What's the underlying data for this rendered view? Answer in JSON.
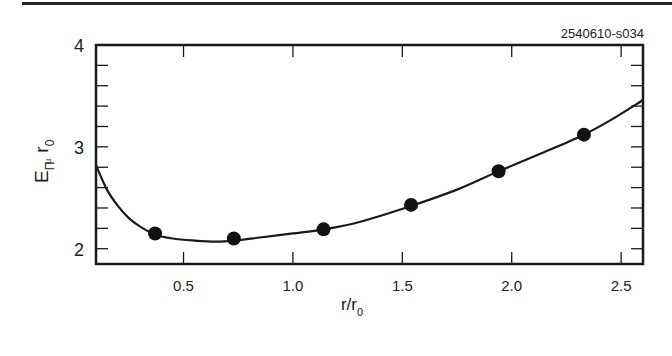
{
  "figure": {
    "id_label": "2540610-s034",
    "xlabel_main": "r/r",
    "xlabel_sub": "0",
    "ylabel_main": "E",
    "ylabel_sub1": "Π",
    "ylabel_sub2": "u",
    "ylabel_r": "r",
    "ylabel_r_sub": "0"
  },
  "chart_data": {
    "type": "scatter",
    "title": "",
    "xlabel": "r/r0",
    "ylabel": "E_Πu r0",
    "xlim": [
      0.1,
      2.6
    ],
    "ylim": [
      1.85,
      4.0
    ],
    "x_ticks": [
      0.5,
      1.0,
      1.5,
      2.0,
      2.5
    ],
    "x_tick_labels": [
      "0.5",
      "1.0",
      "1.5",
      "2.0",
      "2.5"
    ],
    "y_ticks": [
      2,
      3,
      4
    ],
    "y_tick_labels": [
      "2",
      "3",
      "4"
    ],
    "grid": false,
    "legend": null,
    "annotation": "2540610-s034",
    "series": [
      {
        "name": "data points",
        "style": "filled-circle",
        "x": [
          0.37,
          0.73,
          1.14,
          1.54,
          1.94,
          2.33
        ],
        "y": [
          2.15,
          2.1,
          2.19,
          2.43,
          2.76,
          3.12
        ]
      },
      {
        "name": "fit curve",
        "style": "line",
        "x": [
          0.1,
          0.15,
          0.2,
          0.25,
          0.3,
          0.37,
          0.45,
          0.55,
          0.65,
          0.73,
          0.85,
          1.0,
          1.14,
          1.3,
          1.54,
          1.75,
          1.94,
          2.15,
          2.33,
          2.45,
          2.6
        ],
        "y": [
          2.82,
          2.58,
          2.42,
          2.3,
          2.22,
          2.14,
          2.1,
          2.08,
          2.07,
          2.08,
          2.11,
          2.15,
          2.19,
          2.26,
          2.42,
          2.58,
          2.76,
          2.95,
          3.12,
          3.26,
          3.46
        ]
      }
    ]
  }
}
